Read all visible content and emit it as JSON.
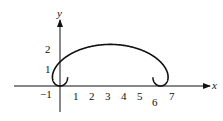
{
  "chart_data": {
    "type": "line",
    "title": "",
    "xlabel": "x",
    "ylabel": "y",
    "x_ticks": [
      "-1",
      "1",
      "2",
      "3",
      "4",
      "5",
      "6",
      "7"
    ],
    "y_ticks": [
      "1",
      "2"
    ],
    "xlim": [
      -1.3,
      8.2
    ],
    "ylim": [
      -1.2,
      5
    ],
    "series": [
      {
        "name": "curve",
        "parametric": "x = t - 1.6 sin t, y = 1 + 1.5 (1 - cos t)/2 style loops",
        "features": {
          "self_intersection_left": [
            0,
            1
          ],
          "self_intersection_right": [
            6.28,
            1
          ],
          "arc_peak": [
            3.14,
            2.55
          ],
          "loop_bottom": -0.6
        }
      }
    ],
    "grid": false,
    "legend": null
  },
  "labels": {
    "x_axis": "x",
    "y_axis": "y",
    "xt_m1": "−1",
    "xt_1": "1",
    "xt_2": "2",
    "xt_3": "3",
    "xt_4": "4",
    "xt_5": "5",
    "xt_6": "6",
    "xt_7": "7",
    "yt_1": "1",
    "yt_2": "2"
  }
}
